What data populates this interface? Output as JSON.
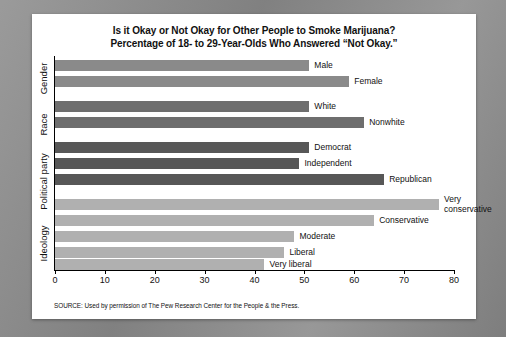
{
  "chart_data": {
    "type": "bar",
    "orientation": "horizontal",
    "title": "Is it Okay or Not Okay for Other People to Smoke Marijuana?",
    "subtitle": "Percentage of 18- to 29-Year-Olds Who Answered “Not Okay.”",
    "xlabel": "",
    "ylabel": "",
    "xlim": [
      0,
      80
    ],
    "xticks": [
      0,
      10,
      20,
      30,
      40,
      50,
      60,
      70,
      80
    ],
    "grid": false,
    "legend": "none",
    "source": "SOURCE: Used by permission of The Pew Research Center for the People & the Press.",
    "groups": [
      {
        "name": "Gender",
        "color": "#8a8a8a",
        "categories": [
          "Male",
          "Female"
        ],
        "values": [
          51,
          59
        ]
      },
      {
        "name": "Race",
        "color": "#6e6e6e",
        "categories": [
          "White",
          "Nonwhite"
        ],
        "values": [
          51,
          62
        ]
      },
      {
        "name": "Political party",
        "color": "#575757",
        "categories": [
          "Democrat",
          "Independent",
          "Republican"
        ],
        "values": [
          51,
          49,
          66
        ]
      },
      {
        "name": "Ideology",
        "color": "#b0b0b0",
        "categories": [
          "Very conservative",
          "Conservative",
          "Moderate",
          "Liberal",
          "Very liberal"
        ],
        "values": [
          77,
          64,
          48,
          46,
          42
        ]
      }
    ],
    "categories": [
      "Male",
      "Female",
      "White",
      "Nonwhite",
      "Democrat",
      "Independent",
      "Republican",
      "Very conservative",
      "Conservative",
      "Moderate",
      "Liberal",
      "Very liberal"
    ],
    "values": [
      51,
      59,
      51,
      62,
      51,
      49,
      66,
      77,
      64,
      48,
      46,
      42
    ]
  },
  "group_labels": {
    "gender": "Gender",
    "race": "Race",
    "political_party": "Political party",
    "ideology": "Ideology"
  },
  "bar_labels": {
    "male": "Male",
    "female": "Female",
    "white": "White",
    "nonwhite": "Nonwhite",
    "democrat": "Democrat",
    "independent": "Independent",
    "republican": "Republican",
    "very_conservative": "Very conservative",
    "conservative": "Conservative",
    "moderate": "Moderate",
    "liberal": "Liberal",
    "very_liberal": "Very liberal"
  },
  "axis": {
    "t0": "0",
    "t10": "10",
    "t20": "20",
    "t30": "30",
    "t40": "40",
    "t50": "50",
    "t60": "60",
    "t70": "70",
    "t80": "80"
  }
}
